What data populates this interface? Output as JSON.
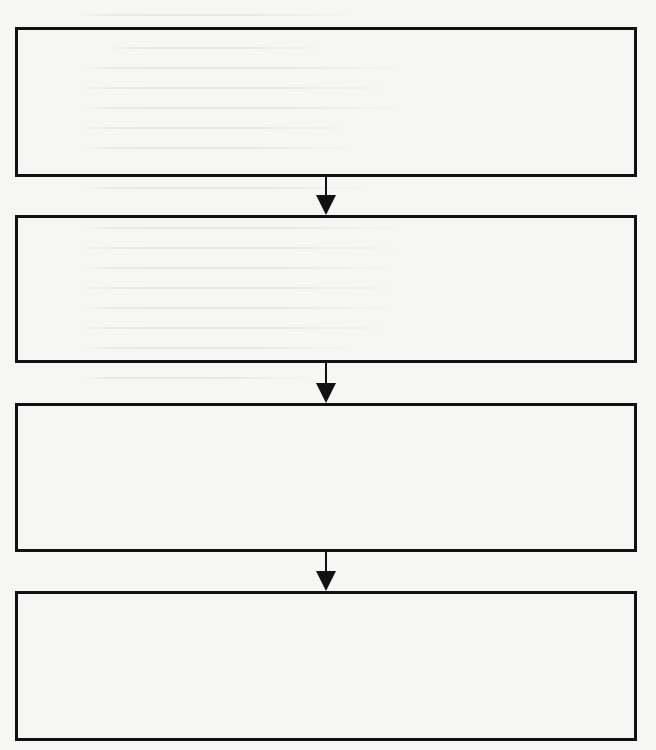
{
  "diagram": {
    "type": "flowchart",
    "direction": "top-to-bottom",
    "nodes": [
      {
        "id": "step-1",
        "label": ""
      },
      {
        "id": "step-2",
        "label": ""
      },
      {
        "id": "step-3",
        "label": ""
      },
      {
        "id": "step-4",
        "label": ""
      }
    ],
    "edges": [
      {
        "from": "step-1",
        "to": "step-2"
      },
      {
        "from": "step-2",
        "to": "step-3"
      },
      {
        "from": "step-3",
        "to": "step-4"
      }
    ],
    "colors": {
      "stroke": "#111111",
      "background": "#f6f6f4"
    }
  }
}
